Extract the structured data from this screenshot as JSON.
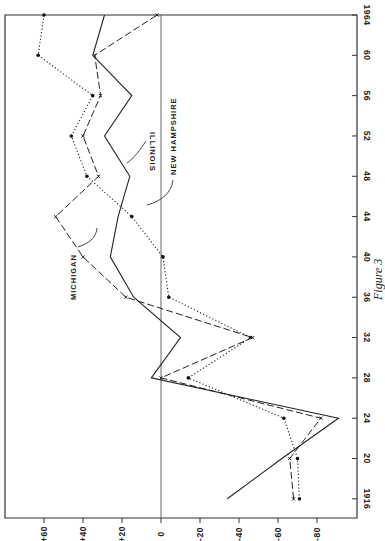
{
  "chart_data": {
    "type": "line",
    "orientation": "rotated-90",
    "title": "",
    "caption": "Figure 3",
    "xlabel": "",
    "ylabel": "",
    "x": [
      1916,
      1920,
      1924,
      1928,
      1932,
      1936,
      1940,
      1944,
      1948,
      1952,
      1956,
      1960,
      1964
    ],
    "x_tick_labels": [
      "1916",
      "20",
      "24",
      "28",
      "32",
      "36",
      "40",
      "44",
      "48",
      "52",
      "56",
      "60",
      "1964"
    ],
    "y_ticks": [
      60,
      40,
      20,
      0,
      -20,
      -40,
      -60,
      -80
    ],
    "y_tick_labels": [
      "+60",
      "+40",
      "+20",
      "0",
      "-20",
      "-40",
      "-60",
      "-80"
    ],
    "ylim": [
      -100,
      80
    ],
    "xlim": [
      1914,
      1964
    ],
    "grid": false,
    "zero_line": true,
    "series": [
      {
        "name": "NEW HAMPSHIRE",
        "style": "dotted",
        "marker": "dot",
        "values": [
          -71,
          -70,
          -63,
          -14,
          -46,
          -4,
          -1,
          15,
          38,
          46,
          35,
          63,
          60
        ]
      },
      {
        "name": "MICHIGAN",
        "style": "dashed",
        "marker": "x",
        "values": [
          -68,
          -66,
          -82,
          0,
          -47,
          18,
          40,
          54,
          32,
          40,
          31,
          34,
          2
        ]
      },
      {
        "name": "ILLINOIS",
        "style": "solid",
        "marker": "none",
        "values": [
          -34,
          -62,
          -91,
          5,
          -10,
          14,
          26,
          22,
          16,
          29,
          15,
          35,
          29
        ]
      }
    ],
    "legend": "inline-labels"
  },
  "labels": {
    "michigan": "MICHIGAN",
    "illinois": "ILLINOIS",
    "new_hampshire": "NEW HAMPSHIRE",
    "caption": "Figure 3"
  }
}
